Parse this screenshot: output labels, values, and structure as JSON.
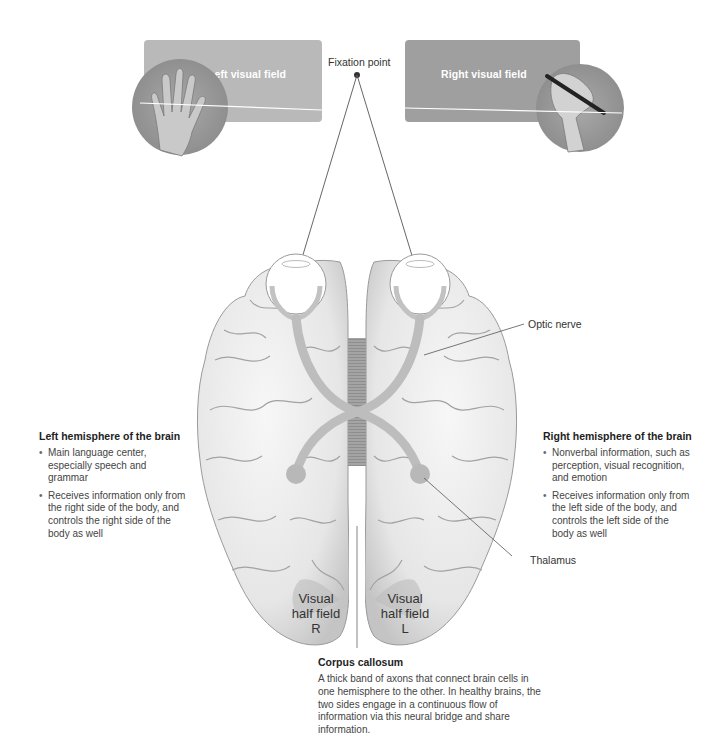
{
  "visual_fields": {
    "left": {
      "label": "Left visual field",
      "panel_color": "#b9b9b9",
      "image": "hand-flat-icon"
    },
    "right": {
      "label": "Right visual field",
      "panel_color": "#9f9f9f",
      "image": "hand-writing-pen-icon"
    }
  },
  "fixation_point": {
    "label": "Fixation point"
  },
  "left_hemisphere": {
    "title": "Left hemisphere of the brain",
    "bullets": [
      "Main language center, especially speech and grammar",
      "Receives information only from the right side of the body, and controls the right side of the body as well"
    ]
  },
  "right_hemisphere": {
    "title": "Right hemisphere of the brain",
    "bullets": [
      "Nonverbal information, such as perception, visual recognition, and emotion",
      "Receives information only from the left side of the body, and controls the left side of the body as well"
    ]
  },
  "callouts": {
    "optic_nerve": "Optic nerve",
    "thalamus": "Thalamus"
  },
  "half_fields": {
    "left_lobe": {
      "line1": "Visual",
      "line2": "half field",
      "line3": "R"
    },
    "right_lobe": {
      "line1": "Visual",
      "line2": "half field",
      "line3": "L"
    }
  },
  "corpus_callosum": {
    "title": "Corpus callosum",
    "description": "A thick band of axons that connect brain cells in one hemisphere to the other. In healthy brains, the two sides engage in a continuous flow of information via this neural bridge and share information."
  },
  "colors": {
    "brain_fill": "#ececec",
    "brain_stroke": "#8a8a8a",
    "pathway": "#bdbdbd",
    "corpus": "#a8a8a8",
    "line": "#555555"
  }
}
